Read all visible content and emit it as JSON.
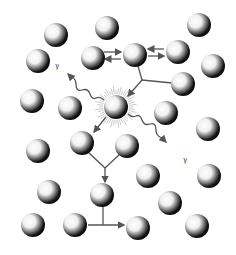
{
  "diagram": {
    "title": "",
    "colors": {
      "background": "#ffffff",
      "arrow": "#555555",
      "ball_dark": "#111111",
      "ball_light": "#ffffff",
      "halo": "#999999"
    },
    "labels": {
      "gamma_left": "γ",
      "gamma_right": "γ"
    },
    "particles": [
      {
        "id": "p1",
        "x": 56,
        "y": 35
      },
      {
        "id": "p2",
        "x": 107,
        "y": 28
      },
      {
        "id": "p3",
        "x": 199,
        "y": 25
      },
      {
        "id": "p4",
        "x": 38,
        "y": 61
      },
      {
        "id": "p5",
        "x": 93,
        "y": 58
      },
      {
        "id": "p6",
        "x": 135,
        "y": 55
      },
      {
        "id": "p7",
        "x": 178,
        "y": 52
      },
      {
        "id": "p8",
        "x": 213,
        "y": 66
      },
      {
        "id": "p9",
        "x": 183,
        "y": 84
      },
      {
        "id": "p10",
        "x": 32,
        "y": 101
      },
      {
        "id": "p11",
        "x": 70,
        "y": 108
      },
      {
        "id": "p12",
        "x": 116,
        "y": 107,
        "excited": true
      },
      {
        "id": "p13",
        "x": 166,
        "y": 113
      },
      {
        "id": "p14",
        "x": 208,
        "y": 129
      },
      {
        "id": "p15",
        "x": 82,
        "y": 143
      },
      {
        "id": "p16",
        "x": 127,
        "y": 146
      },
      {
        "id": "p17",
        "x": 38,
        "y": 151
      },
      {
        "id": "p18",
        "x": 148,
        "y": 176
      },
      {
        "id": "p19",
        "x": 209,
        "y": 176
      },
      {
        "id": "p20",
        "x": 49,
        "y": 192
      },
      {
        "id": "p21",
        "x": 102,
        "y": 195
      },
      {
        "id": "p22",
        "x": 170,
        "y": 203
      },
      {
        "id": "p23",
        "x": 33,
        "y": 225
      },
      {
        "id": "p24",
        "x": 75,
        "y": 225
      },
      {
        "id": "p25",
        "x": 138,
        "y": 228
      },
      {
        "id": "p26",
        "x": 197,
        "y": 226
      }
    ]
  }
}
